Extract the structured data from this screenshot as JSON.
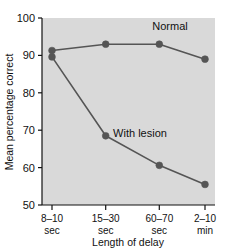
{
  "chart_data": {
    "type": "line",
    "title": "",
    "xlabel": "Length of delay",
    "ylabel": "Mean percentage correct",
    "categories": [
      "8–10 sec",
      "15–30 sec",
      "60–70 sec",
      "2–10 min"
    ],
    "category_lines": [
      [
        "8–10",
        "sec"
      ],
      [
        "15–30",
        "sec"
      ],
      [
        "60–70",
        "sec"
      ],
      [
        "2–10",
        "min"
      ]
    ],
    "yticks": [
      100,
      90,
      80,
      70,
      60,
      50
    ],
    "ylim": [
      50,
      100
    ],
    "grid": false,
    "legend_position": "inline-annotations",
    "series": [
      {
        "name": "Normal",
        "values": [
          91.3,
          93.0,
          93.0,
          89.0
        ],
        "color": "#555555",
        "label_x": 170,
        "label_y": 30
      },
      {
        "name": "With lesion",
        "values": [
          89.6,
          68.5,
          60.6,
          55.5
        ],
        "color": "#555555",
        "label_x": 140,
        "label_y": 137
      }
    ],
    "plot_background": "#d9d9d9",
    "axis_color": "#111111",
    "marker_color": "#555555",
    "line_color": "#555555"
  }
}
